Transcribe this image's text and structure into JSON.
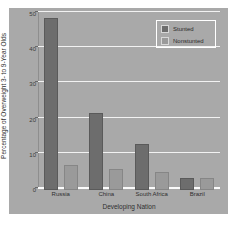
{
  "chart_data": {
    "type": "bar",
    "title": "",
    "xlabel": "Developing Nation",
    "ylabel": "Percentage of Overweight 3- to 9-Year Olds",
    "categories": [
      "Russia",
      "China",
      "South Africa",
      "Brazil"
    ],
    "series": [
      {
        "name": "Stunted",
        "color": "#6d6d6d",
        "values": [
          49,
          22,
          13,
          3.5
        ]
      },
      {
        "name": "Nonstunted",
        "color": "#9a9a9a",
        "values": [
          7,
          6,
          5,
          3.5
        ]
      }
    ],
    "ylim": [
      0,
      50
    ],
    "yticks": [
      0,
      10,
      20,
      30,
      40,
      50
    ],
    "ytick_labels": [
      "0",
      "10",
      "20",
      "30",
      "40",
      "50"
    ],
    "grid": true,
    "legend_position": "top-right",
    "panel_background": "#a9a9a9",
    "gridline_color": "#f2f2f2"
  },
  "legend": {
    "items": [
      {
        "label": "Stunted"
      },
      {
        "label": "Nonstunted"
      }
    ]
  }
}
